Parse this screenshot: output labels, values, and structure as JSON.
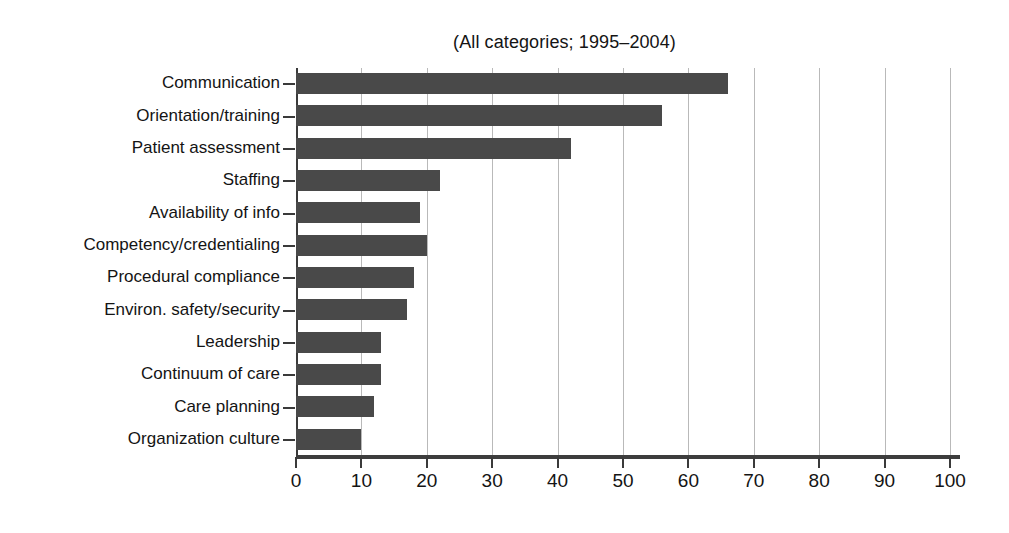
{
  "chart_data": {
    "type": "bar",
    "orientation": "horizontal",
    "title": "(All categories; 1995–2004)",
    "xlabel": "",
    "ylabel": "",
    "xlim": [
      0,
      100
    ],
    "xticks": [
      0,
      10,
      20,
      30,
      40,
      50,
      60,
      70,
      80,
      90,
      100
    ],
    "xtick_labels": [
      "0",
      "10",
      "20",
      "30",
      "40",
      "50",
      "60",
      "70",
      "80",
      "90",
      "100"
    ],
    "grid": "vertical",
    "legend": "none",
    "bar_color": "#494949",
    "categories": [
      "Communication",
      "Orientation/training",
      "Patient assessment",
      "Staffing",
      "Availability of info",
      "Competency/credentialing",
      "Procedural compliance",
      "Environ. safety/security",
      "Leadership",
      "Continuum of care",
      "Care planning",
      "Organization culture"
    ],
    "values": [
      66,
      56,
      42,
      22,
      19,
      20,
      18,
      17,
      13,
      13,
      12,
      10
    ],
    "series": [
      {
        "name": "Root cause",
        "values": [
          66,
          56,
          42,
          22,
          19,
          20,
          18,
          17,
          13,
          13,
          12,
          10
        ]
      }
    ]
  }
}
